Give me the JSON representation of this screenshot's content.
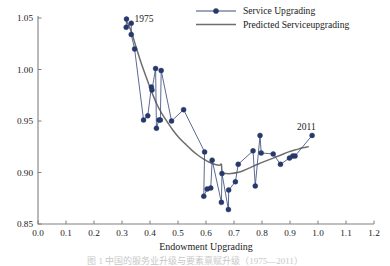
{
  "chart_data": {
    "type": "scatter",
    "title": "",
    "xlabel": "Endowment Upgrading",
    "ylabel": "",
    "xlim": [
      0.0,
      1.2
    ],
    "ylim": [
      0.85,
      1.05
    ],
    "grid": false,
    "legend_position": "top-right",
    "xticks": [
      "0.0",
      "0.1",
      "0.2",
      "0.3",
      "0.4",
      "0.5",
      "0.6",
      "0.7",
      "0.8",
      "0.9",
      "1.0",
      "1.1",
      "1.2"
    ],
    "yticks": [
      "0.85",
      "0.90",
      "0.95",
      "1.00",
      "1.05"
    ],
    "annotations": [
      {
        "text": "1975",
        "x": 0.345,
        "y": 1.046
      },
      {
        "text": "2011",
        "x": 0.925,
        "y": 0.941
      }
    ],
    "series": [
      {
        "name": "Service Upgrading",
        "type": "scatter-line",
        "color": "#27386a",
        "marker": "filled-circle",
        "points": [
          [
            0.316,
            1.049
          ],
          [
            0.315,
            1.041
          ],
          [
            0.333,
            1.045
          ],
          [
            0.333,
            1.034
          ],
          [
            0.345,
            1.02
          ],
          [
            0.377,
            0.951
          ],
          [
            0.392,
            0.955
          ],
          [
            0.405,
            0.983
          ],
          [
            0.407,
            0.98
          ],
          [
            0.42,
            1.001
          ],
          [
            0.423,
            0.943
          ],
          [
            0.432,
            0.951
          ],
          [
            0.437,
            0.951
          ],
          [
            0.44,
            0.999
          ],
          [
            0.477,
            0.95
          ],
          [
            0.52,
            0.961
          ],
          [
            0.595,
            0.92
          ],
          [
            0.592,
            0.877
          ],
          [
            0.604,
            0.884
          ],
          [
            0.617,
            0.885
          ],
          [
            0.622,
            0.912
          ],
          [
            0.655,
            0.871
          ],
          [
            0.657,
            0.899
          ],
          [
            0.68,
            0.864
          ],
          [
            0.681,
            0.883
          ],
          [
            0.705,
            0.891
          ],
          [
            0.715,
            0.908
          ],
          [
            0.768,
            0.921
          ],
          [
            0.776,
            0.887
          ],
          [
            0.793,
            0.936
          ],
          [
            0.797,
            0.919
          ],
          [
            0.84,
            0.918
          ],
          [
            0.866,
            0.908
          ],
          [
            0.898,
            0.914
          ],
          [
            0.91,
            0.916
          ],
          [
            0.918,
            0.916
          ],
          [
            0.979,
            0.936
          ]
        ]
      },
      {
        "name": "Predicted Serviceupgrading",
        "type": "line",
        "color": "#6e6e6e",
        "points": [
          [
            0.316,
            1.047
          ],
          [
            0.333,
            1.037
          ],
          [
            0.35,
            1.022
          ],
          [
            0.37,
            1.005
          ],
          [
            0.39,
            0.99
          ],
          [
            0.408,
            0.977
          ],
          [
            0.425,
            0.966
          ],
          [
            0.443,
            0.957
          ],
          [
            0.462,
            0.949
          ],
          [
            0.482,
            0.941
          ],
          [
            0.503,
            0.934
          ],
          [
            0.525,
            0.928
          ],
          [
            0.548,
            0.922
          ],
          [
            0.57,
            0.917
          ],
          [
            0.592,
            0.913
          ],
          [
            0.612,
            0.91
          ],
          [
            0.63,
            0.908
          ],
          [
            0.648,
            0.907
          ],
          [
            0.655,
            0.908
          ],
          [
            0.658,
            0.9
          ],
          [
            0.672,
            0.899
          ],
          [
            0.69,
            0.899
          ],
          [
            0.712,
            0.9
          ],
          [
            0.735,
            0.902
          ],
          [
            0.76,
            0.905
          ],
          [
            0.785,
            0.908
          ],
          [
            0.812,
            0.911
          ],
          [
            0.84,
            0.914
          ],
          [
            0.868,
            0.917
          ],
          [
            0.895,
            0.92
          ],
          [
            0.92,
            0.922
          ],
          [
            0.945,
            0.924
          ],
          [
            0.965,
            0.925
          ]
        ]
      }
    ]
  },
  "legend": {
    "items": [
      {
        "label": "Service Upgrading",
        "style": "line-marker",
        "color": "#27386a"
      },
      {
        "label": "Predicted Serviceupgrading",
        "style": "line",
        "color": "#6e6e6e"
      }
    ]
  },
  "caption": "图 1  中国的服务业升级与要素禀赋升级（1975—2011）"
}
